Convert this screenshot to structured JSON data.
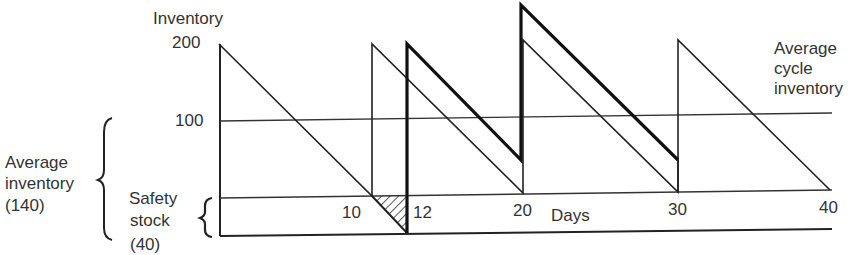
{
  "diagram": {
    "y_axis_title": "Inventory",
    "y_ticks": [
      {
        "label": "200",
        "value": 200
      },
      {
        "label": "100",
        "value": 100
      }
    ],
    "x_axis_title": "Days",
    "x_ticks": [
      {
        "label": "10",
        "value": 10
      },
      {
        "label": "12",
        "value": 12
      },
      {
        "label": "20",
        "value": 20
      },
      {
        "label": "30",
        "value": 30
      },
      {
        "label": "40",
        "value": 40
      }
    ],
    "annotations": {
      "average_cycle_inventory": [
        "Average",
        "cycle",
        "inventory"
      ],
      "average_inventory": [
        "Average",
        "inventory",
        "(140)"
      ],
      "safety_stock": [
        "Safety",
        "stock",
        "(40)"
      ]
    },
    "series": [
      {
        "name": "Inventory without safety stock (thin)",
        "points": [
          [
            0,
            200
          ],
          [
            10,
            0
          ],
          [
            10,
            200
          ],
          [
            20,
            0
          ],
          [
            20,
            200
          ],
          [
            30,
            0
          ],
          [
            30,
            200
          ],
          [
            40,
            0
          ]
        ]
      },
      {
        "name": "Inventory with safety stock (thick)",
        "points": [
          [
            10,
            40
          ],
          [
            12,
            0
          ],
          [
            12,
            240
          ],
          [
            20,
            80
          ],
          [
            20,
            280
          ],
          [
            30,
            120
          ]
        ]
      }
    ],
    "shaded_region": {
      "name": "stockout",
      "x_range": [
        10,
        12
      ]
    }
  }
}
